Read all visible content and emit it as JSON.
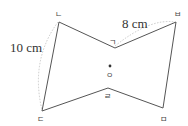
{
  "diagram": {
    "type": "point-symmetric hexagon",
    "vertices": [
      {
        "label": "ㄴ",
        "x": 59,
        "y": 22
      },
      {
        "label": "ㄱ",
        "x": 115,
        "y": 48
      },
      {
        "label": "ㅂ",
        "x": 176,
        "y": 22
      },
      {
        "label": "ㅁ",
        "x": 163,
        "y": 108
      },
      {
        "label": "ㄹ",
        "x": 108,
        "y": 88
      },
      {
        "label": "ㄷ",
        "x": 42,
        "y": 111
      }
    ],
    "center": {
      "label": "ㅇ",
      "x": 110,
      "y": 68
    },
    "measurements": {
      "side_ㄴㄷ": "10 cm",
      "side_ㄱㅂ": "8 cm"
    },
    "colors": {
      "stroke": "#555555",
      "dashed": "#bbbbbb"
    }
  }
}
